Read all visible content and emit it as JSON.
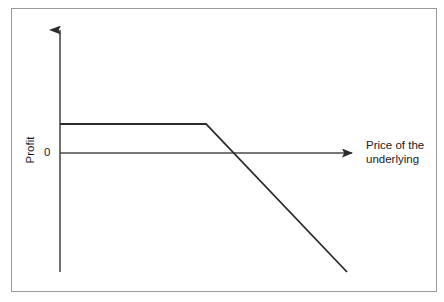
{
  "figure": {
    "width": 444,
    "height": 302,
    "background": "#ffffff",
    "border_color": "#9a9a9a",
    "line_color": "#2b2b2b",
    "text_color": "#1a1a1a"
  },
  "labels": {
    "y_axis_title": "Profit",
    "zero_tick": "0",
    "x_axis_title_line1": "Price of the",
    "x_axis_title_line2": "underlying"
  },
  "chart_data": {
    "type": "line",
    "title": "",
    "subtitle": "",
    "xlabel": "Price of the underlying",
    "ylabel": "Profit",
    "grid": false,
    "legend": "none",
    "annotations": [
      {
        "text": "0",
        "role": "y-axis-zero-tick"
      }
    ],
    "axes": {
      "x_axis": {
        "kind": "arrow",
        "label": "Price of the underlying",
        "ticks": [],
        "origin_px": [
          60,
          153
        ],
        "end_px": [
          358,
          153
        ],
        "arrowhead": true
      },
      "y_axis": {
        "kind": "arrow",
        "label": "Profit",
        "ticks": [
          "0"
        ],
        "origin_px": [
          60,
          272
        ],
        "end_px": [
          60,
          27
        ],
        "arrowhead": true
      }
    },
    "series": [
      {
        "name": "Short call profit",
        "description": "Flat at the premium received until the strike, then declining linearly",
        "points_px": [
          [
            60,
            124
          ],
          [
            206,
            124
          ],
          [
            347,
            272
          ]
        ],
        "x": [
          0,
          1,
          2
        ],
        "values": [
          1,
          1,
          -2.1
        ],
        "breakpoints": [
          {
            "role": "strike",
            "px": [
              206,
              124
            ]
          },
          {
            "role": "breakeven",
            "px": [
              231,
              153
            ]
          }
        ]
      }
    ],
    "ylim": [
      -2.6,
      2.2
    ],
    "xlim": [
      0,
      2.05
    ]
  }
}
